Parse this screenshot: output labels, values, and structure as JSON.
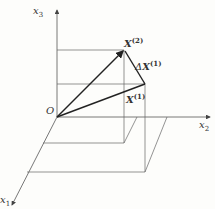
{
  "diagram": {
    "axes": {
      "x1": {
        "label": "x",
        "sub": "1"
      },
      "x2": {
        "label": "x",
        "sub": "2"
      },
      "x3": {
        "label": "x",
        "sub": "3"
      }
    },
    "origin": {
      "label": "O"
    },
    "vectors": {
      "x2_vec": {
        "label": "X",
        "sup": "(2)"
      },
      "x1_vec": {
        "label": "X",
        "sup": "(1)"
      },
      "delta": {
        "prefix": "Δ",
        "label": "X",
        "sup": "(1)"
      }
    },
    "colors": {
      "line": "#555555",
      "vector": "#222222",
      "background": "#fdfdfb"
    }
  }
}
